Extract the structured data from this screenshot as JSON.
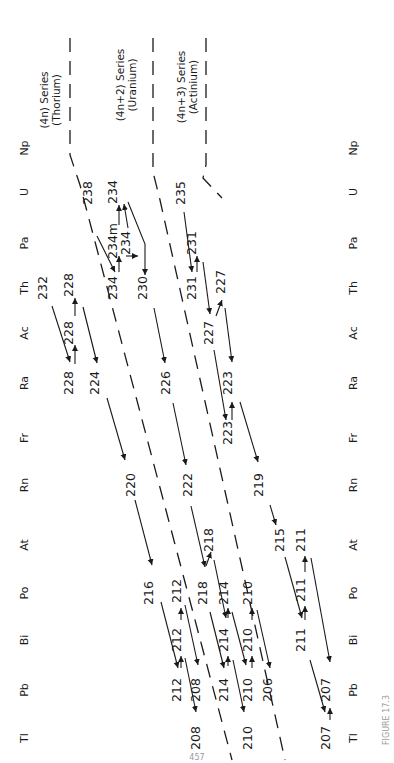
{
  "figure": {
    "element_axis_left": [
      {
        "symbol": "Np",
        "y": 148
      },
      {
        "symbol": "U",
        "y": 192
      },
      {
        "symbol": "Pa",
        "y": 243
      },
      {
        "symbol": "Th",
        "y": 288
      },
      {
        "symbol": "Ac",
        "y": 333
      },
      {
        "symbol": "Ra",
        "y": 383
      },
      {
        "symbol": "Fr",
        "y": 438
      },
      {
        "symbol": "Rn",
        "y": 485
      },
      {
        "symbol": "At",
        "y": 545
      },
      {
        "symbol": "Po",
        "y": 593
      },
      {
        "symbol": "Bi",
        "y": 640
      },
      {
        "symbol": "Pb",
        "y": 690
      },
      {
        "symbol": "Tl",
        "y": 738
      }
    ],
    "series_labels": [
      {
        "line1": "(4n) Series",
        "line2": "(Thorium)",
        "x": 48,
        "y": 100
      },
      {
        "line1": "(4n+2) Series",
        "line2": "(Uranium)",
        "x": 124,
        "y": 85
      },
      {
        "line1": "(4n+3) Series",
        "line2": "(Actinium)",
        "x": 185,
        "y": 87
      }
    ],
    "nuclides": [
      {
        "mass": "232",
        "x": 47,
        "y": 288
      },
      {
        "mass": "228",
        "x": 73,
        "y": 383
      },
      {
        "mass": "228",
        "x": 73,
        "y": 333
      },
      {
        "mass": "228",
        "x": 73,
        "y": 285
      },
      {
        "mass": "224",
        "x": 99,
        "y": 383
      },
      {
        "mass": "220",
        "x": 135,
        "y": 485
      },
      {
        "mass": "216",
        "x": 153,
        "y": 593
      },
      {
        "mass": "212",
        "x": 181,
        "y": 591
      },
      {
        "mass": "212",
        "x": 181,
        "y": 640
      },
      {
        "mass": "212",
        "x": 181,
        "y": 690
      },
      {
        "mass": "208",
        "x": 200,
        "y": 690
      },
      {
        "mass": "208",
        "x": 200,
        "y": 738
      },
      {
        "mass": "238",
        "x": 92,
        "y": 193
      },
      {
        "mass": "234",
        "x": 117,
        "y": 192
      },
      {
        "mass": "234m",
        "x": 117,
        "y": 241
      },
      {
        "mass": "234",
        "x": 130,
        "y": 243
      },
      {
        "mass": "234",
        "x": 117,
        "y": 288
      },
      {
        "mass": "230",
        "x": 147,
        "y": 288
      },
      {
        "mass": "226",
        "x": 170,
        "y": 383
      },
      {
        "mass": "222",
        "x": 192,
        "y": 485
      },
      {
        "mass": "218",
        "x": 213,
        "y": 540
      },
      {
        "mass": "218",
        "x": 207,
        "y": 593
      },
      {
        "mass": "214",
        "x": 228,
        "y": 593
      },
      {
        "mass": "214",
        "x": 228,
        "y": 640
      },
      {
        "mass": "214",
        "x": 228,
        "y": 690
      },
      {
        "mass": "210",
        "x": 252,
        "y": 593
      },
      {
        "mass": "210",
        "x": 252,
        "y": 640
      },
      {
        "mass": "210",
        "x": 252,
        "y": 690
      },
      {
        "mass": "210",
        "x": 252,
        "y": 738
      },
      {
        "mass": "206",
        "x": 272,
        "y": 690
      },
      {
        "mass": "235",
        "x": 185,
        "y": 193
      },
      {
        "mass": "231",
        "x": 196,
        "y": 243
      },
      {
        "mass": "231",
        "x": 196,
        "y": 288
      },
      {
        "mass": "227",
        "x": 225,
        "y": 282
      },
      {
        "mass": "227",
        "x": 213,
        "y": 333
      },
      {
        "mass": "223",
        "x": 232,
        "y": 383
      },
      {
        "mass": "223",
        "x": 232,
        "y": 433
      },
      {
        "mass": "219",
        "x": 263,
        "y": 485
      },
      {
        "mass": "215",
        "x": 284,
        "y": 540
      },
      {
        "mass": "211",
        "x": 305,
        "y": 540
      },
      {
        "mass": "211",
        "x": 305,
        "y": 590
      },
      {
        "mass": "211",
        "x": 305,
        "y": 640
      },
      {
        "mass": "207",
        "x": 330,
        "y": 690
      },
      {
        "mass": "207",
        "x": 330,
        "y": 738
      }
    ],
    "element_axis_right_x": 357,
    "caption_fragment": "FIGURE 17.3",
    "page_number": "457"
  }
}
